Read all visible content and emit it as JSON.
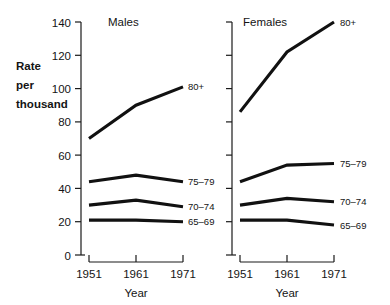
{
  "chart_data": {
    "type": "line",
    "title": "",
    "ylabel_lines": [
      "Rate",
      "per",
      "thousand"
    ],
    "xlabel": "Year",
    "x": [
      1951,
      1961,
      1971
    ],
    "xtick_labels": [
      "1951",
      "1961",
      "1971"
    ],
    "ytick_labels": [
      "0",
      "20",
      "40",
      "60",
      "80",
      "100",
      "120",
      "140"
    ],
    "ytick_values": [
      0,
      20,
      40,
      60,
      80,
      100,
      120,
      140
    ],
    "ylim": [
      0,
      140
    ],
    "grid": false,
    "legend_position": "inline-right-of-line-end",
    "panels": [
      {
        "name": "males",
        "title": "Males",
        "series": [
          {
            "name": "80+",
            "label": "80+",
            "values": [
              70,
              90,
              101
            ]
          },
          {
            "name": "75-79",
            "label": "75–79",
            "values": [
              44,
              48,
              44
            ]
          },
          {
            "name": "70-74",
            "label": "70–74",
            "values": [
              30,
              33,
              29
            ]
          },
          {
            "name": "65-69",
            "label": "65–69",
            "values": [
              21,
              21,
              20
            ]
          }
        ]
      },
      {
        "name": "females",
        "title": "Females",
        "series": [
          {
            "name": "80+",
            "label": "80+",
            "values": [
              86,
              122,
              140
            ]
          },
          {
            "name": "75-79",
            "label": "75–79",
            "values": [
              44,
              54,
              55
            ]
          },
          {
            "name": "70-74",
            "label": "70–74",
            "values": [
              30,
              34,
              32
            ]
          },
          {
            "name": "65-69",
            "label": "65–69",
            "values": [
              21,
              21,
              18
            ]
          }
        ]
      }
    ]
  }
}
